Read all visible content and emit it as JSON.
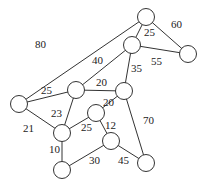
{
  "graph": {
    "type": "weighted-undirected-graph",
    "node_radius": 8.5,
    "nodes": [
      {
        "id": "A",
        "x": 146,
        "y": 17
      },
      {
        "id": "B",
        "x": 132,
        "y": 45
      },
      {
        "id": "C",
        "x": 188,
        "y": 54
      },
      {
        "id": "D",
        "x": 19,
        "y": 104
      },
      {
        "id": "E",
        "x": 76,
        "y": 90
      },
      {
        "id": "F",
        "x": 124,
        "y": 91
      },
      {
        "id": "G",
        "x": 96,
        "y": 113
      },
      {
        "id": "H",
        "x": 62,
        "y": 133
      },
      {
        "id": "I",
        "x": 111,
        "y": 141
      },
      {
        "id": "J",
        "x": 62,
        "y": 170
      },
      {
        "id": "K",
        "x": 146,
        "y": 163
      }
    ],
    "edges": [
      {
        "from": "A",
        "to": "D",
        "weight": "80",
        "lx": 35,
        "ly": 48
      },
      {
        "from": "A",
        "to": "B",
        "weight": "25",
        "lx": 144,
        "ly": 36
      },
      {
        "from": "A",
        "to": "C",
        "weight": "60",
        "lx": 171,
        "ly": 28
      },
      {
        "from": "B",
        "to": "E",
        "weight": "40",
        "lx": 92,
        "ly": 64
      },
      {
        "from": "B",
        "to": "C",
        "weight": "55",
        "lx": 151,
        "ly": 65
      },
      {
        "from": "B",
        "to": "F",
        "weight": "35",
        "lx": 131,
        "ly": 72
      },
      {
        "from": "D",
        "to": "E",
        "weight": "25",
        "lx": 41,
        "ly": 94
      },
      {
        "from": "E",
        "to": "F",
        "weight": "20",
        "lx": 96,
        "ly": 86
      },
      {
        "from": "D",
        "to": "H",
        "weight": "21",
        "lx": 23,
        "ly": 132
      },
      {
        "from": "E",
        "to": "H",
        "weight": "23",
        "lx": 51,
        "ly": 117
      },
      {
        "from": "F",
        "to": "G",
        "weight": "20",
        "lx": 103,
        "ly": 106
      },
      {
        "from": "F",
        "to": "K",
        "weight": "70",
        "lx": 143,
        "ly": 124
      },
      {
        "from": "H",
        "to": "G",
        "weight": "25",
        "lx": 81,
        "ly": 131
      },
      {
        "from": "G",
        "to": "I",
        "weight": "12",
        "lx": 105,
        "ly": 129
      },
      {
        "from": "H",
        "to": "J",
        "weight": "10",
        "lx": 49,
        "ly": 153
      },
      {
        "from": "J",
        "to": "I",
        "weight": "30",
        "lx": 89,
        "ly": 164
      },
      {
        "from": "I",
        "to": "K",
        "weight": "45",
        "lx": 118,
        "ly": 164
      }
    ]
  }
}
